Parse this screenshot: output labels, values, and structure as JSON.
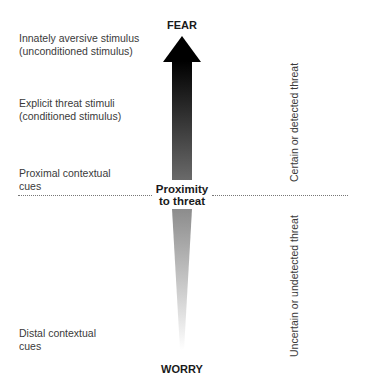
{
  "diagram": {
    "top_label": "FEAR",
    "bottom_label": "WORRY",
    "center_label_line1": "Proximity",
    "center_label_line2": "to threat",
    "left_labels": [
      {
        "line1": "Innately aversive stimulus",
        "line2": "(unconditioned stimulus)"
      },
      {
        "line1": "Explicit threat stimuli",
        "line2": "(conditioned stimulus)"
      },
      {
        "line1": "Proximal contextual",
        "line2": "cues"
      },
      {
        "line1": "Distal contextual",
        "line2": "cues"
      }
    ],
    "right_labels": {
      "upper": "Certain or detected threat",
      "lower": "Uncertain or undetected threat"
    },
    "colors": {
      "arrow_top": "#000000",
      "arrow_bottom": "#ffffff",
      "divider": "#777777"
    }
  }
}
